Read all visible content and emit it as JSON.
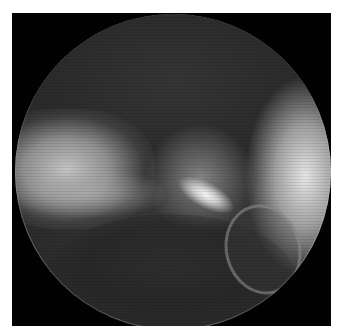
{
  "image": {
    "type": "fluoroscopy-xray",
    "description": "Circular grayscale fluoroscopic image of a bone joint",
    "colors": {
      "background": "#ffffff",
      "frame": "#020202",
      "bright_bone": "#f0f0f0",
      "soft_tissue": "#333333"
    }
  }
}
